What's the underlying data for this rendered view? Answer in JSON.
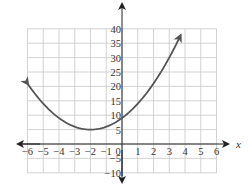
{
  "chart_data": {
    "type": "line",
    "title": "",
    "xlabel": "x",
    "ylabel": "y",
    "xlim": [
      -6,
      6
    ],
    "ylim": [
      -10,
      40
    ],
    "grid": true,
    "x_ticks": [
      -6,
      -5,
      -4,
      -3,
      -2,
      -1,
      0,
      1,
      2,
      3,
      4,
      5,
      6
    ],
    "x_tick_labels": [
      "−6",
      "−5",
      "−4",
      "−3",
      "−2",
      "−1",
      "0",
      "1",
      "2",
      "3",
      "4",
      "5",
      "6"
    ],
    "y_ticks": [
      -10,
      -5,
      5,
      10,
      15,
      20,
      25,
      30,
      35,
      40
    ],
    "y_tick_labels": [
      "−10",
      "−5",
      "5",
      "10",
      "15",
      "20",
      "25",
      "30",
      "35",
      "40"
    ],
    "series": [
      {
        "name": "parabola",
        "equation": "y = (x + 2)^2 + 5",
        "vertex": [
          -2,
          5
        ],
        "x": [
          -6,
          -5,
          -4,
          -3,
          -2,
          -1,
          0,
          1,
          2,
          3,
          3.7
        ],
        "values": [
          21,
          14,
          9,
          6,
          5,
          6,
          9,
          14,
          21,
          30,
          37.5
        ],
        "arrows_both_ends": true,
        "color": "#555555"
      }
    ]
  },
  "colors": {
    "grid": "#c8c8c8",
    "axis": "#222222",
    "curve": "#555555"
  }
}
